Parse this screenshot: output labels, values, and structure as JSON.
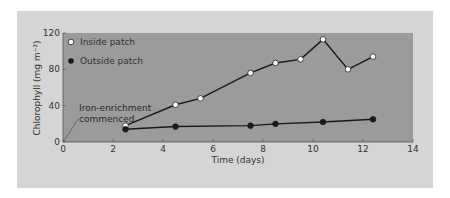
{
  "chart_data": {
    "type": "line",
    "title": "",
    "xlabel": "Time (days)",
    "ylabel": "Chlorophyll (mg m⁻²)",
    "xlim": [
      0,
      14
    ],
    "ylim": [
      0,
      120
    ],
    "xticks": [
      0,
      2,
      4,
      6,
      8,
      10,
      12,
      14
    ],
    "yticks": [
      0,
      40,
      80,
      120
    ],
    "legend_position": "upper-left",
    "grid": false,
    "series": [
      {
        "name": "Inside patch",
        "marker": "open-circle",
        "x": [
          2.5,
          4.5,
          5.5,
          7.5,
          8.5,
          9.5,
          10.4,
          11.4,
          12.4
        ],
        "values": [
          18,
          41,
          48,
          76,
          87,
          91,
          113,
          80,
          94
        ]
      },
      {
        "name": "Outside patch",
        "marker": "filled-circle",
        "x": [
          2.5,
          4.5,
          7.5,
          8.5,
          10.4,
          12.4
        ],
        "values": [
          14,
          17,
          18,
          20,
          22,
          25
        ]
      }
    ],
    "annotations": [
      {
        "text_line1": "Iron-enrichment",
        "text_line2": "commenced",
        "points_to_x": 0,
        "points_to_y": 0
      }
    ]
  },
  "colors": {
    "panel": "#d5d5d5",
    "plot_area": "#9b9b9b",
    "line": "#1a1a1a",
    "open_marker": "#ffffff",
    "filled_marker": "#1a1a1a"
  }
}
